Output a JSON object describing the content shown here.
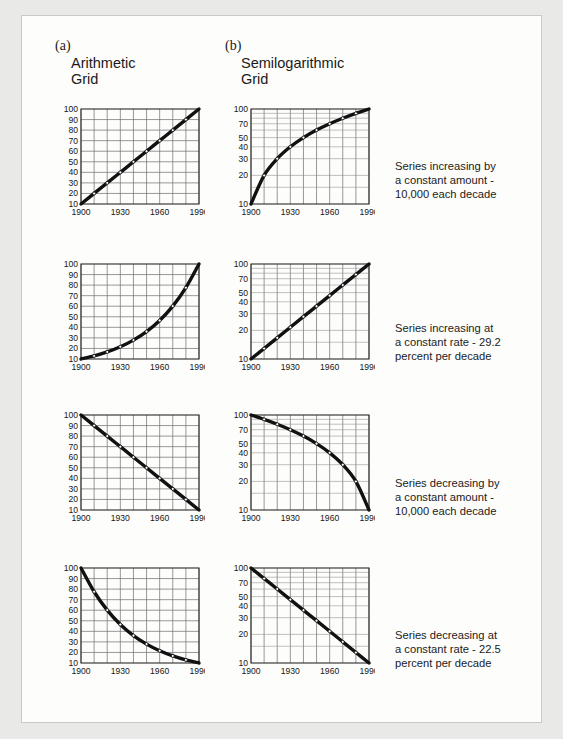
{
  "figure": {
    "panels": [
      {
        "letter": "(a)",
        "title": "Arithmetic\nGrid"
      },
      {
        "letter": "(b)",
        "title": "Semilogarithmic\nGrid"
      }
    ],
    "captions": [
      "Series increasing by\na constant amount -\n10,000 each decade",
      "Series increasing at\na constant rate  - 29.2\npercent per decade",
      "Series decreasing by\na constant amount -\n10,000 each decade",
      "Series decreasing at\na constant rate - 22.5\npercent per decade"
    ]
  },
  "chart_data": [
    {
      "id": "row1-arithmetic",
      "type": "line",
      "title": "Arithmetic Grid",
      "row": 1,
      "column": "arithmetic",
      "scale": "linear",
      "xlabel": "",
      "ylabel": "",
      "xlim": [
        1900,
        1990
      ],
      "ylim": [
        10,
        100
      ],
      "grid": true,
      "xticks": [
        1900,
        1930,
        1960,
        1990
      ],
      "xticklabels": [
        "1900",
        "1930",
        "1960",
        "1990"
      ],
      "yticks": [
        10,
        20,
        30,
        40,
        50,
        60,
        70,
        80,
        90,
        100
      ],
      "yticklabels": [
        "10",
        "20",
        "30",
        "40",
        "50",
        "60",
        "70",
        "80",
        "90",
        "100"
      ],
      "x": [
        1900,
        1910,
        1920,
        1930,
        1940,
        1950,
        1960,
        1970,
        1980,
        1990
      ],
      "values": [
        10,
        20,
        30,
        40,
        50,
        60,
        70,
        80,
        90,
        100
      ]
    },
    {
      "id": "row1-semilog",
      "type": "line",
      "title": "Semilogarithmic Grid",
      "row": 1,
      "column": "semilog",
      "scale": "log",
      "xlabel": "",
      "ylabel": "",
      "xlim": [
        1900,
        1990
      ],
      "ylim": [
        10,
        100
      ],
      "grid": true,
      "xticks": [
        1900,
        1930,
        1960,
        1990
      ],
      "xticklabels": [
        "1900",
        "1930",
        "1960",
        "1990"
      ],
      "yticks": [
        10,
        20,
        30,
        40,
        50,
        70,
        100
      ],
      "yticklabels": [
        "10",
        "20",
        "30",
        "40",
        "50",
        "70",
        "100"
      ],
      "x": [
        1900,
        1910,
        1920,
        1930,
        1940,
        1950,
        1960,
        1970,
        1980,
        1990
      ],
      "values": [
        10,
        20,
        30,
        40,
        50,
        60,
        70,
        80,
        90,
        100
      ]
    },
    {
      "id": "row2-arithmetic",
      "type": "line",
      "title": "Arithmetic Grid",
      "row": 2,
      "column": "arithmetic",
      "scale": "linear",
      "xlabel": "",
      "ylabel": "",
      "xlim": [
        1900,
        1990
      ],
      "ylim": [
        10,
        100
      ],
      "grid": true,
      "xticks": [
        1900,
        1930,
        1960,
        1990
      ],
      "xticklabels": [
        "1900",
        "1930",
        "1960",
        "1990"
      ],
      "yticks": [
        10,
        20,
        30,
        40,
        50,
        60,
        70,
        80,
        90,
        100
      ],
      "yticklabels": [
        "10",
        "20",
        "30",
        "40",
        "50",
        "60",
        "70",
        "80",
        "90",
        "100"
      ],
      "x": [
        1900,
        1910,
        1920,
        1930,
        1940,
        1950,
        1960,
        1970,
        1980,
        1990
      ],
      "values": [
        10,
        12.9,
        16.7,
        21.6,
        27.9,
        36,
        46.5,
        60.1,
        77.6,
        100
      ]
    },
    {
      "id": "row2-semilog",
      "type": "line",
      "title": "Semilogarithmic Grid",
      "row": 2,
      "column": "semilog",
      "scale": "log",
      "xlabel": "",
      "ylabel": "",
      "xlim": [
        1900,
        1990
      ],
      "ylim": [
        10,
        100
      ],
      "grid": true,
      "xticks": [
        1900,
        1930,
        1960,
        1990
      ],
      "xticklabels": [
        "1900",
        "1930",
        "1960",
        "1990"
      ],
      "yticks": [
        10,
        20,
        30,
        40,
        50,
        70,
        100
      ],
      "yticklabels": [
        "10",
        "20",
        "30",
        "40",
        "50",
        "70",
        "100"
      ],
      "x": [
        1900,
        1910,
        1920,
        1930,
        1940,
        1950,
        1960,
        1970,
        1980,
        1990
      ],
      "values": [
        10,
        12.9,
        16.7,
        21.6,
        27.9,
        36,
        46.5,
        60.1,
        77.6,
        100
      ]
    },
    {
      "id": "row3-arithmetic",
      "type": "line",
      "title": "Arithmetic Grid",
      "row": 3,
      "column": "arithmetic",
      "scale": "linear",
      "xlabel": "",
      "ylabel": "",
      "xlim": [
        1900,
        1990
      ],
      "ylim": [
        10,
        100
      ],
      "grid": true,
      "xticks": [
        1900,
        1930,
        1960,
        1990
      ],
      "xticklabels": [
        "1900",
        "1930",
        "1960",
        "1990"
      ],
      "yticks": [
        10,
        20,
        30,
        40,
        50,
        60,
        70,
        80,
        90,
        100
      ],
      "yticklabels": [
        "10",
        "20",
        "30",
        "40",
        "50",
        "60",
        "70",
        "80",
        "90",
        "100"
      ],
      "x": [
        1900,
        1910,
        1920,
        1930,
        1940,
        1950,
        1960,
        1970,
        1980,
        1990
      ],
      "values": [
        100,
        90,
        80,
        70,
        60,
        50,
        40,
        30,
        20,
        10
      ]
    },
    {
      "id": "row3-semilog",
      "type": "line",
      "title": "Semilogarithmic Grid",
      "row": 3,
      "column": "semilog",
      "scale": "log",
      "xlabel": "",
      "ylabel": "",
      "xlim": [
        1900,
        1990
      ],
      "ylim": [
        10,
        100
      ],
      "grid": true,
      "xticks": [
        1900,
        1930,
        1960,
        1990
      ],
      "xticklabels": [
        "1900",
        "1930",
        "1960",
        "1990"
      ],
      "yticks": [
        10,
        20,
        30,
        40,
        50,
        70,
        100
      ],
      "yticklabels": [
        "10",
        "20",
        "30",
        "40",
        "50",
        "70",
        "100"
      ],
      "x": [
        1900,
        1910,
        1920,
        1930,
        1940,
        1950,
        1960,
        1970,
        1980,
        1990
      ],
      "values": [
        100,
        90,
        80,
        70,
        60,
        50,
        40,
        30,
        20,
        10
      ]
    },
    {
      "id": "row4-arithmetic",
      "type": "line",
      "title": "Arithmetic Grid",
      "row": 4,
      "column": "arithmetic",
      "scale": "linear",
      "xlabel": "",
      "ylabel": "",
      "xlim": [
        1900,
        1990
      ],
      "ylim": [
        10,
        100
      ],
      "grid": true,
      "xticks": [
        1900,
        1930,
        1960,
        1990
      ],
      "xticklabels": [
        "1900",
        "1930",
        "1960",
        "1990"
      ],
      "yticks": [
        10,
        20,
        30,
        40,
        50,
        60,
        70,
        80,
        90,
        100
      ],
      "yticklabels": [
        "10",
        "20",
        "30",
        "40",
        "50",
        "60",
        "70",
        "80",
        "90",
        "100"
      ],
      "x": [
        1900,
        1910,
        1920,
        1930,
        1940,
        1950,
        1960,
        1970,
        1980,
        1990
      ],
      "values": [
        100,
        77.5,
        60.1,
        46.5,
        36,
        27.9,
        21.6,
        16.7,
        12.9,
        10
      ]
    },
    {
      "id": "row4-semilog",
      "type": "line",
      "title": "Semilogarithmic Grid",
      "row": 4,
      "column": "semilog",
      "scale": "log",
      "xlabel": "",
      "ylabel": "",
      "xlim": [
        1900,
        1990
      ],
      "ylim": [
        10,
        100
      ],
      "grid": true,
      "xticks": [
        1900,
        1930,
        1960,
        1990
      ],
      "xticklabels": [
        "1900",
        "1930",
        "1960",
        "1990"
      ],
      "yticks": [
        10,
        20,
        30,
        40,
        50,
        70,
        100
      ],
      "yticklabels": [
        "10",
        "20",
        "30",
        "40",
        "50",
        "70",
        "100"
      ],
      "x": [
        1900,
        1910,
        1920,
        1930,
        1940,
        1950,
        1960,
        1970,
        1980,
        1990
      ],
      "values": [
        100,
        77.5,
        60.1,
        46.5,
        36,
        27.9,
        21.6,
        16.7,
        12.9,
        10
      ]
    }
  ]
}
